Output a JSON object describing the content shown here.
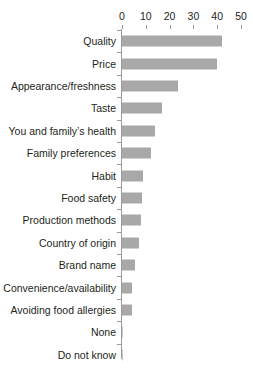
{
  "chart_data": {
    "type": "bar",
    "orientation": "horizontal",
    "title": "",
    "subtitle": "",
    "xlabel": "",
    "ylabel": "",
    "xlim": [
      0,
      50
    ],
    "xticks": [
      0,
      10,
      20,
      30,
      40,
      50
    ],
    "xtick_labels": [
      "0",
      "10",
      "20",
      "30",
      "40",
      "50"
    ],
    "grid": false,
    "legend": false,
    "axis_position": "top",
    "bar_color": "#a8a8a8",
    "background_color": "#ffffff",
    "categories": [
      "Quality",
      "Price",
      "Appearance/freshness",
      "Taste",
      "You and family’s health",
      "Family preferences",
      "Habit",
      "Food safety",
      "Production methods",
      "Country of origin",
      "Brand name",
      "Convenience/availability",
      "Avoiding food allergies",
      "None",
      "Do not know"
    ],
    "values": [
      42,
      40,
      23.5,
      17,
      14,
      12,
      9,
      8.5,
      8,
      7,
      5.5,
      4,
      4,
      0.3,
      0.3
    ]
  }
}
